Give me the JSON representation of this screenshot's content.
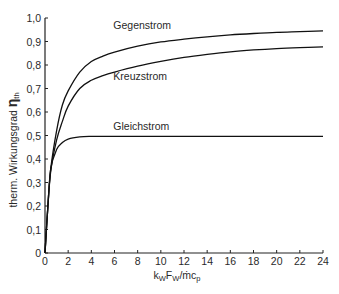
{
  "chart_data": {
    "type": "line",
    "title": "",
    "xlabel": "k_W F_W / ṁ c_p",
    "xlabel_parts": {
      "k": "k",
      "k_sub": "W",
      "F": "F",
      "F_sub": "W",
      "slash": "/",
      "m": "ṁ",
      "c": "c",
      "c_sub": "p"
    },
    "ylabel": "therm. Wirkungsgrad η_th",
    "ylabel_parts": {
      "text": "therm. Wirkungsgrad ",
      "symbol": "η",
      "sub": "th"
    },
    "xlim": [
      0,
      24
    ],
    "ylim": [
      0,
      1.0
    ],
    "x_ticks": [
      0,
      2,
      4,
      6,
      8,
      10,
      12,
      14,
      16,
      18,
      20,
      22,
      24
    ],
    "x_tick_labels": [
      "0",
      "2",
      "4",
      "6",
      "8",
      "10",
      "12",
      "14",
      "16",
      "18",
      "20",
      "22",
      "24"
    ],
    "y_ticks": [
      0,
      0.1,
      0.2,
      0.3,
      0.4,
      0.5,
      0.6,
      0.7,
      0.8,
      0.9,
      1.0
    ],
    "y_tick_labels": [
      "0",
      "0,1",
      "0,2",
      "0,3",
      "0,4",
      "0,5",
      "0,6",
      "0,7",
      "0,8",
      "0,9",
      "1,0"
    ],
    "grid": false,
    "legend": "inline labels",
    "series": [
      {
        "name": "Gegenstrom",
        "label_pos": {
          "x": 5.9,
          "y": 0.955
        },
        "x": [
          0,
          0.25,
          0.5,
          1,
          1.5,
          2,
          3,
          4,
          5,
          6,
          8,
          10,
          12,
          14,
          16,
          18,
          20,
          22,
          24
        ],
        "values": [
          0,
          0.2,
          0.36,
          0.52,
          0.63,
          0.69,
          0.77,
          0.815,
          0.838,
          0.855,
          0.88,
          0.898,
          0.91,
          0.92,
          0.928,
          0.934,
          0.939,
          0.942,
          0.945
        ]
      },
      {
        "name": "Kreuzstrom",
        "label_pos": {
          "x": 5.9,
          "y": 0.735
        },
        "x": [
          0,
          0.25,
          0.5,
          1,
          1.5,
          2,
          3,
          4,
          5,
          6,
          8,
          10,
          12,
          14,
          16,
          18,
          20,
          22,
          24
        ],
        "values": [
          0,
          0.2,
          0.35,
          0.48,
          0.56,
          0.625,
          0.7,
          0.735,
          0.755,
          0.77,
          0.795,
          0.815,
          0.832,
          0.845,
          0.856,
          0.864,
          0.87,
          0.874,
          0.877
        ]
      },
      {
        "name": "Gleichstrom",
        "label_pos": {
          "x": 5.9,
          "y": 0.525
        },
        "x": [
          0,
          0.25,
          0.5,
          1,
          1.5,
          2,
          3,
          4,
          6,
          10,
          16,
          24
        ],
        "values": [
          0,
          0.2,
          0.36,
          0.44,
          0.47,
          0.485,
          0.494,
          0.496,
          0.496,
          0.496,
          0.496,
          0.496
        ]
      }
    ],
    "style": {
      "line_color": "#111111",
      "axis_color": "#222222",
      "text_color": "#2a2a2a",
      "background": "#ffffff"
    }
  }
}
